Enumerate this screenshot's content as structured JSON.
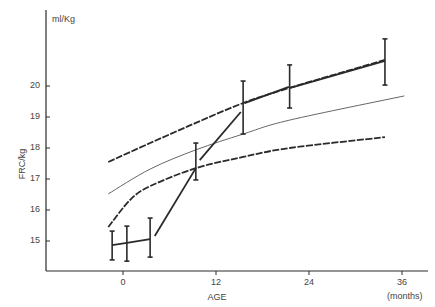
{
  "chart_data": {
    "type": "line",
    "title": "",
    "xlabel": "AGE",
    "x_unit_label": "(months)",
    "ylabel": "FRC/kg",
    "y_unit_label": "ml/Kg",
    "xlim": [
      -10,
      39
    ],
    "ylim": [
      14.0,
      22.5
    ],
    "x_ticks": [
      0,
      12,
      24,
      36
    ],
    "x_tick_labels": [
      "0",
      "12",
      "24",
      "36"
    ],
    "y_ticks": [
      15,
      16,
      17,
      18,
      19,
      20
    ],
    "y_tick_labels": [
      "15",
      "16",
      "17",
      "18",
      "19",
      "20"
    ],
    "grid": false,
    "legend": null,
    "series": [
      {
        "name": "measured FRC (mean ± range)",
        "style": "solid-thick-with-error-bars",
        "points": [
          {
            "x": -1.4,
            "y": 14.87,
            "low": 14.39,
            "high": 15.32
          },
          {
            "x": 0.5,
            "y": 14.94,
            "low": 14.35,
            "high": 15.48
          },
          {
            "x": 3.5,
            "y": 15.06,
            "low": 14.48,
            "high": 15.74
          },
          {
            "x": 9.4,
            "y": 17.35,
            "low": 16.97,
            "high": 18.16
          },
          {
            "x": 15.5,
            "y": 19.45,
            "low": 18.45,
            "high": 20.16
          },
          {
            "x": 21.5,
            "y": 19.94,
            "low": 19.29,
            "high": 20.68
          },
          {
            "x": 33.8,
            "y": 20.81,
            "low": 20.03,
            "high": 21.52
          }
        ],
        "segments": [
          [
            [
              -1.4,
              14.87
            ],
            [
              0.5,
              14.94
            ],
            [
              3.5,
              15.06
            ]
          ],
          [
            [
              4.1,
              15.16
            ],
            [
              9.4,
              17.35
            ]
          ],
          [
            [
              9.9,
              17.61
            ],
            [
              15.2,
              19.16
            ]
          ],
          [
            [
              15.7,
              19.45
            ],
            [
              21.4,
              19.97
            ]
          ],
          [
            [
              21.6,
              19.94
            ],
            [
              33.8,
              20.81
            ]
          ]
        ]
      },
      {
        "name": "upper limit",
        "style": "dashed-thick",
        "x": [
          -1.9,
          3.5,
          9.4,
          15.5,
          21.5,
          33.8
        ],
        "y": [
          17.55,
          18.16,
          18.81,
          19.45,
          19.94,
          20.84
        ]
      },
      {
        "name": "mean reference",
        "style": "solid-thin",
        "x": [
          -1.9,
          3.5,
          9.4,
          15.5,
          21.5,
          36.3
        ],
        "y": [
          16.52,
          17.32,
          17.94,
          18.45,
          18.9,
          19.68
        ]
      },
      {
        "name": "lower limit",
        "style": "dashed-thick",
        "x": [
          -1.9,
          0.9,
          3.5,
          9.4,
          15.5,
          21.5,
          33.8
        ],
        "y": [
          15.45,
          16.32,
          16.77,
          17.35,
          17.71,
          18.0,
          18.35
        ]
      }
    ]
  },
  "layout": {
    "axis_left_px": 46,
    "axis_top_px": 10,
    "axis_bottom_px": 271,
    "axis_right_px": 428,
    "x0_px": 123,
    "px_per_month": 7.75,
    "y20_px": 86,
    "px_per_unit": 31,
    "colors": {
      "ink": "#2a2a2a",
      "thin": "#555555",
      "label": "#444444"
    }
  }
}
